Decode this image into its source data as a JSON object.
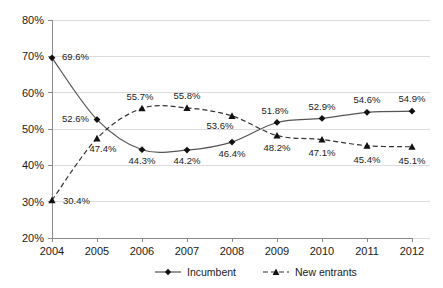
{
  "chart_data": {
    "type": "line",
    "title": "",
    "subtitle": "",
    "xlabel": "",
    "ylabel": "",
    "categories": [
      "2004",
      "2005",
      "2006",
      "2007",
      "2008",
      "2009",
      "2010",
      "2011",
      "2012"
    ],
    "ylim": [
      20,
      80
    ],
    "ytick_labels": [
      "20%",
      "30%",
      "40%",
      "50%",
      "60%",
      "70%",
      "80%"
    ],
    "ytick_values": [
      20,
      30,
      40,
      50,
      60,
      70,
      80
    ],
    "grid": true,
    "legend_position": "bottom-center",
    "series": [
      {
        "name": "Incumbent",
        "marker": "diamond",
        "line_style": "solid",
        "color": "#555555",
        "values": [
          69.6,
          52.6,
          44.3,
          44.2,
          46.4,
          51.8,
          52.9,
          54.6,
          54.9
        ],
        "data_labels": [
          "69.6%",
          "52.6%",
          "44.3%",
          "44.2%",
          "46.4%",
          "51.8%",
          "52.9%",
          "54.6%",
          "54.9%"
        ]
      },
      {
        "name": "New entrants",
        "marker": "triangle",
        "line_style": "dashed",
        "color": "#333333",
        "values": [
          30.4,
          47.4,
          55.7,
          55.8,
          53.6,
          48.2,
          47.1,
          45.4,
          45.1
        ],
        "data_labels": [
          "30.4%",
          "47.4%",
          "55.7%",
          "55.8%",
          "53.6%",
          "48.2%",
          "47.1%",
          "45.4%",
          "45.1%"
        ]
      }
    ]
  },
  "legend": {
    "items": [
      {
        "label": "Incumbent",
        "marker": "diamond",
        "line_style": "solid"
      },
      {
        "label": "New entrants",
        "marker": "triangle",
        "line_style": "dashed"
      }
    ]
  },
  "label_layout": {
    "incumbent_offsets": [
      {
        "dx": 10,
        "dy": 2,
        "anchor": "start"
      },
      {
        "dx": -8,
        "dy": 2,
        "anchor": "end"
      },
      {
        "dx": 0,
        "dy": 14,
        "anchor": "middle"
      },
      {
        "dx": 0,
        "dy": 14,
        "anchor": "middle"
      },
      {
        "dx": 0,
        "dy": 15,
        "anchor": "middle"
      },
      {
        "dx": -2,
        "dy": -8,
        "anchor": "middle"
      },
      {
        "dx": 0,
        "dy": -8,
        "anchor": "middle"
      },
      {
        "dx": 0,
        "dy": -9,
        "anchor": "middle"
      },
      {
        "dx": 0,
        "dy": -9,
        "anchor": "middle"
      }
    ],
    "new_entrants_offsets": [
      {
        "dx": 11,
        "dy": 4,
        "anchor": "start"
      },
      {
        "dx": 6,
        "dy": 14,
        "anchor": "middle"
      },
      {
        "dx": -2,
        "dy": -8,
        "anchor": "middle"
      },
      {
        "dx": 0,
        "dy": -9,
        "anchor": "middle"
      },
      {
        "dx": -12,
        "dy": 13,
        "anchor": "middle"
      },
      {
        "dx": 0,
        "dy": 15,
        "anchor": "middle"
      },
      {
        "dx": 0,
        "dy": 16,
        "anchor": "middle"
      },
      {
        "dx": 0,
        "dy": 17,
        "anchor": "middle"
      },
      {
        "dx": 0,
        "dy": 17,
        "anchor": "middle"
      }
    ]
  },
  "geometry": {
    "plot_left": 52,
    "plot_right": 412,
    "plot_top": 20,
    "plot_bottom": 238,
    "x_step": 45
  }
}
